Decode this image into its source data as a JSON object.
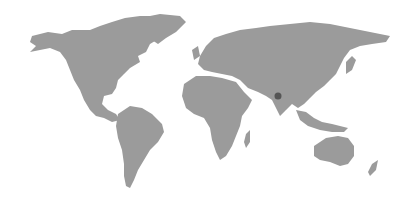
{
  "map": {
    "type": "world-map",
    "land_color": "#9b9b9b",
    "background_color": "#ffffff",
    "marker": {
      "region": "India (central)",
      "x": 278,
      "y": 96,
      "color": "#555555"
    }
  }
}
